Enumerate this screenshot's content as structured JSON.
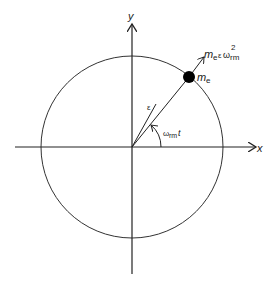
{
  "diagram": {
    "axes": {
      "x_label": "x",
      "y_label": "y"
    },
    "circle": {
      "description": "path of eccentric mass"
    },
    "mass": {
      "label_main": "m",
      "label_sub": "e"
    },
    "force": {
      "m": "m",
      "m_sub": "e",
      "eps": "ε",
      "omega": "ω",
      "omega_sub": "rm",
      "power": "2"
    },
    "radius_label": "ε",
    "angle": {
      "omega": "ω",
      "sub": "rm",
      "t": "t"
    },
    "colors": {
      "line": "#222222",
      "mass": "#000000"
    }
  }
}
